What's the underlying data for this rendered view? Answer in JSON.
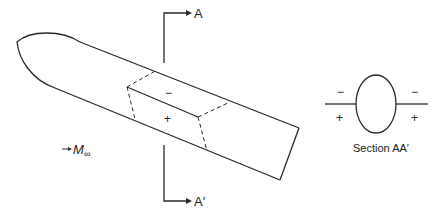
{
  "figure": {
    "section_label_top": "A",
    "section_label_bottom": "A′",
    "freestream_label": "M",
    "freestream_subscript": "∞",
    "upper_sign": "−",
    "lower_sign": "+",
    "section_view": {
      "caption": "Section AA′",
      "left_upper_sign": "−",
      "left_lower_sign": "+",
      "right_upper_sign": "−",
      "right_lower_sign": "+"
    },
    "colors": {
      "stroke": "#2a2a2a",
      "background": "#ffffff"
    }
  }
}
